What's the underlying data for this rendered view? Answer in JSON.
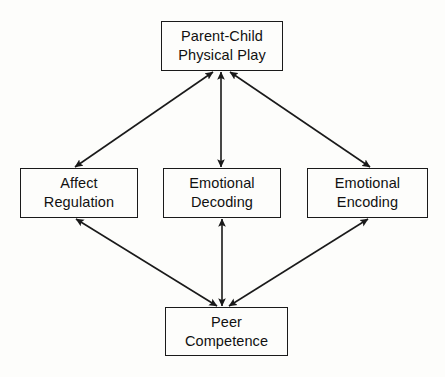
{
  "diagram": {
    "type": "path-model",
    "background_color": "#fdfdfb",
    "line_color": "#1a1a1a",
    "text_color": "#111111",
    "nodes": [
      {
        "id": "parent-child-physical-play",
        "line1": "Parent-Child",
        "line2": "Physical Play",
        "position": "top"
      },
      {
        "id": "affect-regulation",
        "line1": "Affect",
        "line2": "Regulation",
        "position": "middle-left"
      },
      {
        "id": "emotional-decoding",
        "line1": "Emotional",
        "line2": "Decoding",
        "position": "middle-center"
      },
      {
        "id": "emotional-encoding",
        "line1": "Emotional",
        "line2": "Encoding",
        "position": "middle-right"
      },
      {
        "id": "peer-competence",
        "line1": "Peer",
        "line2": "Competence",
        "position": "bottom"
      }
    ],
    "edges": [
      {
        "id": "parent-child-physical-play--affect-regulation",
        "from": "parent-child-physical-play",
        "to": "affect-regulation",
        "style": "double-headed-arrow"
      },
      {
        "id": "parent-child-physical-play--emotional-decoding",
        "from": "parent-child-physical-play",
        "to": "emotional-decoding",
        "style": "double-headed-arrow"
      },
      {
        "id": "parent-child-physical-play--emotional-encoding",
        "from": "parent-child-physical-play",
        "to": "emotional-encoding",
        "style": "double-headed-arrow"
      },
      {
        "id": "affect-regulation--peer-competence",
        "from": "affect-regulation",
        "to": "peer-competence",
        "style": "double-headed-arrow"
      },
      {
        "id": "emotional-decoding--peer-competence",
        "from": "emotional-decoding",
        "to": "peer-competence",
        "style": "double-headed-arrow"
      },
      {
        "id": "emotional-encoding--peer-competence",
        "from": "emotional-encoding",
        "to": "peer-competence",
        "style": "double-headed-arrow"
      }
    ]
  }
}
